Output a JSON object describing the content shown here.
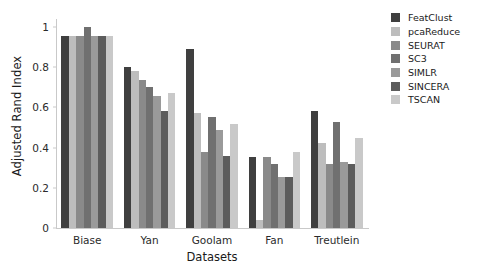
{
  "chart_data": {
    "type": "bar",
    "title": "",
    "xlabel": "Datasets",
    "ylabel": "Adjusted Rand Index",
    "ylim": [
      0,
      1.04
    ],
    "yticks": [
      0,
      0.2,
      0.4,
      0.6,
      0.8,
      1
    ],
    "ytick_labels": [
      "0",
      "0.2",
      "0.4",
      "0.6",
      "0.8",
      "1"
    ],
    "grid": false,
    "legend_position": "right",
    "categories": [
      "Biase",
      "Yan",
      "Goolam",
      "Fan",
      "Treutlein"
    ],
    "series": [
      {
        "name": "FeatClust",
        "color": "#3f3f3f",
        "values": [
          0.955,
          0.8,
          0.89,
          0.355,
          0.58
        ]
      },
      {
        "name": "pcaReduce",
        "color": "#bdbdbd",
        "values": [
          0.955,
          0.78,
          0.57,
          0.04,
          0.425
        ]
      },
      {
        "name": "SEURAT",
        "color": "#8a8a8a",
        "values": [
          0.955,
          0.735,
          0.38,
          0.355,
          0.32
        ]
      },
      {
        "name": "SC3",
        "color": "#707070",
        "values": [
          1.0,
          0.7,
          0.55,
          0.32,
          0.53
        ]
      },
      {
        "name": "SIMLR",
        "color": "#9a9a9a",
        "values": [
          0.955,
          0.655,
          0.49,
          0.255,
          0.33
        ]
      },
      {
        "name": "SINCERA",
        "color": "#5c5c5c",
        "values": [
          0.955,
          0.58,
          0.36,
          0.255,
          0.32
        ]
      },
      {
        "name": "TSCAN",
        "color": "#c9c9c9",
        "values": [
          0.955,
          0.67,
          0.52,
          0.38,
          0.45
        ]
      }
    ]
  },
  "legend": {
    "items": [
      {
        "label": "FeatClust",
        "color": "#3f3f3f"
      },
      {
        "label": "pcaReduce",
        "color": "#bdbdbd"
      },
      {
        "label": "SEURAT",
        "color": "#8a8a8a"
      },
      {
        "label": "SC3",
        "color": "#707070"
      },
      {
        "label": "SIMLR",
        "color": "#9a9a9a"
      },
      {
        "label": "SINCERA",
        "color": "#5c5c5c"
      },
      {
        "label": "TSCAN",
        "color": "#c9c9c9"
      }
    ]
  }
}
